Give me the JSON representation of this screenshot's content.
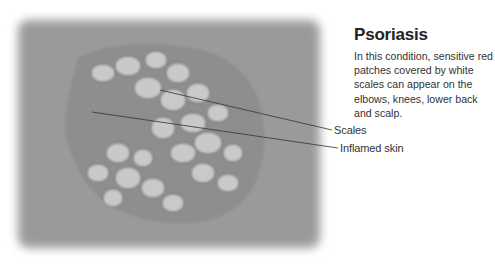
{
  "heading": "Psoriasis",
  "description": "In this condition, sensitive red patches covered by white scales can appear on the elbows, knees, lower back and scalp.",
  "labels": {
    "scales": "Scales",
    "inflamed_skin": "Inflamed skin"
  },
  "image": {
    "subject": "psoriasis skin lesion photograph (grayscale)"
  }
}
